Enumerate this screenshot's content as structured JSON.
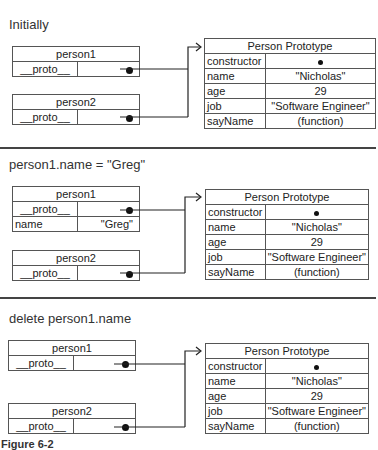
{
  "figure_caption": "Figure 6-2",
  "sections": [
    {
      "title": "Initially",
      "person1": {
        "label": "person1",
        "rows": [
          {
            "key": "__proto__",
            "value": "●"
          }
        ]
      },
      "person2": {
        "label": "person2",
        "rows": [
          {
            "key": "__proto__",
            "value": "●"
          }
        ]
      },
      "prototype": {
        "label": "Person Prototype",
        "rows": [
          {
            "key": "constructor",
            "value": "•"
          },
          {
            "key": "name",
            "value": "\"Nicholas\""
          },
          {
            "key": "age",
            "value": "29"
          },
          {
            "key": "job",
            "value": "\"Software Engineer\""
          },
          {
            "key": "sayName",
            "value": "(function)"
          }
        ]
      }
    },
    {
      "title": "person1.name = \"Greg\"",
      "person1": {
        "label": "person1",
        "rows": [
          {
            "key": "__proto__",
            "value": "●"
          },
          {
            "key": "name",
            "value": "\"Greg\""
          }
        ]
      },
      "person2": {
        "label": "person2",
        "rows": [
          {
            "key": "__proto__",
            "value": "●"
          }
        ]
      },
      "prototype": {
        "label": "Person Prototype",
        "rows": [
          {
            "key": "constructor",
            "value": "•"
          },
          {
            "key": "name",
            "value": "\"Nicholas\""
          },
          {
            "key": "age",
            "value": "29"
          },
          {
            "key": "job",
            "value": "\"Software Engineer\""
          },
          {
            "key": "sayName",
            "value": "(function)"
          }
        ]
      }
    },
    {
      "title": "delete person1.name",
      "person1": {
        "label": "person1",
        "rows": [
          {
            "key": "__proto__",
            "value": "●"
          }
        ]
      },
      "person2": {
        "label": "person2",
        "rows": [
          {
            "key": "__proto__",
            "value": "●"
          }
        ]
      },
      "prototype": {
        "label": "Person Prototype",
        "rows": [
          {
            "key": "constructor",
            "value": "•"
          },
          {
            "key": "name",
            "value": "\"Nicholas\""
          },
          {
            "key": "age",
            "value": "29"
          },
          {
            "key": "job",
            "value": "\"Software Engineer\""
          },
          {
            "key": "sayName",
            "value": "(function)"
          }
        ]
      }
    }
  ]
}
